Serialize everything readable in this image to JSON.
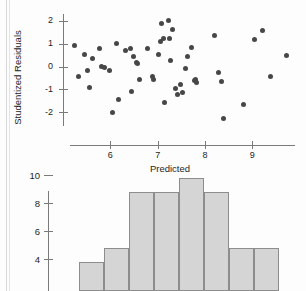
{
  "figure": {
    "page_edges": 2
  },
  "chart_data": [
    {
      "type": "scatter",
      "title": "",
      "xlabel": "Predicted",
      "ylabel": "Studentized Residuals",
      "xlim": [
        5.0,
        9.9
      ],
      "ylim": [
        -2.6,
        2.3
      ],
      "xticks": [
        6,
        7,
        8,
        9
      ],
      "xtick_labels": [
        "6",
        "7",
        "8",
        "9"
      ],
      "yticks": [
        2,
        1,
        0,
        -1,
        -2
      ],
      "ytick_labels": [
        "2",
        "1",
        "0",
        "-1",
        "-2"
      ],
      "grid": false,
      "legend": "none",
      "marker_color": "#474747",
      "points": [
        [
          5.25,
          0.92
        ],
        [
          5.32,
          -0.42
        ],
        [
          5.45,
          0.55
        ],
        [
          5.52,
          -0.19
        ],
        [
          5.55,
          -0.92
        ],
        [
          5.62,
          0.35
        ],
        [
          5.78,
          0.78
        ],
        [
          5.82,
          0.02
        ],
        [
          5.88,
          -0.05
        ],
        [
          5.98,
          -0.19
        ],
        [
          6.05,
          -2.02
        ],
        [
          6.12,
          1.02
        ],
        [
          6.18,
          -1.42
        ],
        [
          6.32,
          0.72
        ],
        [
          6.42,
          0.78
        ],
        [
          6.45,
          -1.08
        ],
        [
          6.48,
          0.42
        ],
        [
          6.55,
          0.18
        ],
        [
          6.58,
          0.12
        ],
        [
          6.62,
          -0.58
        ],
        [
          6.78,
          0.78
        ],
        [
          6.88,
          -0.42
        ],
        [
          6.92,
          -0.55
        ],
        [
          7.02,
          0.52
        ],
        [
          7.05,
          1.08
        ],
        [
          7.08,
          1.88
        ],
        [
          7.12,
          1.22
        ],
        [
          7.15,
          -1.55
        ],
        [
          7.22,
          2.02
        ],
        [
          7.25,
          1.22
        ],
        [
          7.28,
          0.25
        ],
        [
          7.32,
          1.62
        ],
        [
          7.38,
          -0.98
        ],
        [
          7.42,
          -1.22
        ],
        [
          7.48,
          -0.78
        ],
        [
          7.52,
          -1.12
        ],
        [
          7.58,
          -0.08
        ],
        [
          7.62,
          0.45
        ],
        [
          7.72,
          0.85
        ],
        [
          7.78,
          -0.62
        ],
        [
          7.8,
          -0.55
        ],
        [
          7.82,
          -0.68
        ],
        [
          8.2,
          1.35
        ],
        [
          8.28,
          -0.28
        ],
        [
          8.35,
          -0.65
        ],
        [
          8.38,
          -2.28
        ],
        [
          8.82,
          -1.68
        ],
        [
          9.05,
          1.18
        ],
        [
          9.22,
          1.58
        ],
        [
          9.38,
          -0.42
        ],
        [
          9.72,
          0.48
        ]
      ]
    },
    {
      "type": "bar",
      "title": "",
      "xlabel": "",
      "ylabel": "",
      "categories": [
        "1",
        "2",
        "3",
        "4",
        "5",
        "6",
        "7",
        "8"
      ],
      "values": [
        3,
        4,
        8,
        8,
        9,
        8,
        4,
        4
      ],
      "yticks": [
        10,
        8,
        6,
        4
      ],
      "ytick_labels": [
        "10",
        "8",
        "6",
        "4"
      ],
      "ylim": [
        0,
        11
      ],
      "grid": false,
      "legend": "none",
      "bar_fill": "#d5d5d5",
      "bar_stroke": "#8d8d8d"
    }
  ]
}
